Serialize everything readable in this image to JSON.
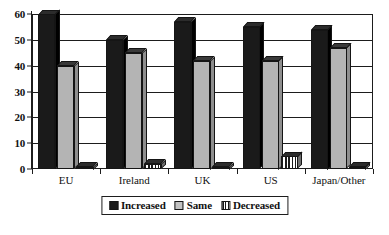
{
  "chart_data": {
    "type": "bar",
    "title": "",
    "subtitle": "",
    "xlabel": "",
    "ylabel": "",
    "ylim": [
      0,
      60
    ],
    "yticks": [
      0,
      10,
      20,
      30,
      40,
      50,
      60
    ],
    "ytick_labels": [
      "0",
      "10",
      "20",
      "30",
      "40",
      "50",
      "60"
    ],
    "grid": true,
    "legend_position": "bottom-center",
    "style": "3d-grouped-bar-monochrome",
    "categories": [
      "EU",
      "Ireland",
      "UK",
      "US",
      "Japan/Other"
    ],
    "series": [
      {
        "name": "Increased",
        "color": "#1a1a1a",
        "pattern": "solid-black",
        "values": [
          60,
          50,
          57,
          55,
          54
        ]
      },
      {
        "name": "Same",
        "color": "#b4b4b4",
        "pattern": "solid-gray",
        "values": [
          40,
          45,
          42,
          42,
          47
        ]
      },
      {
        "name": "Decreased",
        "color": "#ffffff",
        "pattern": "vertical-hatch",
        "values": [
          0.5,
          2,
          0.5,
          5,
          0.5
        ]
      }
    ]
  },
  "legend": {
    "items": [
      {
        "label": "Increased",
        "swatch": "swatch-increased-icon"
      },
      {
        "label": "Same",
        "swatch": "swatch-same-icon"
      },
      {
        "label": "Decreased",
        "swatch": "swatch-decreased-icon"
      }
    ]
  },
  "colors": {
    "increased": "#1a1a1a",
    "same": "#b4b4b4",
    "decreased_line": "#1a1a1a",
    "axis": "#1d1d1d",
    "background": "#ffffff",
    "text": "#111111"
  }
}
